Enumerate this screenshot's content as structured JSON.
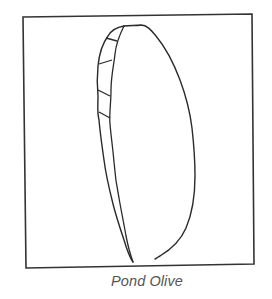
{
  "figure": {
    "caption": "Pond Olive",
    "colors": {
      "stroke": "#2a2a2a",
      "frame": "#333333",
      "caption": "#555555",
      "background": "#ffffff"
    }
  }
}
